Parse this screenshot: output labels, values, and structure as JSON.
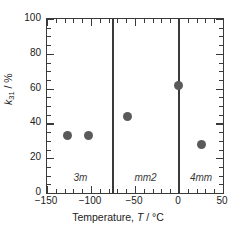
{
  "chart_data": {
    "type": "scatter",
    "title": "",
    "xlabel": "Temperature, T / °C",
    "ylabel": "k31 / %",
    "xlim": [
      -150,
      50
    ],
    "ylim": [
      0,
      100
    ],
    "grid": false,
    "legend": "none",
    "x_major_ticks": [
      -150,
      -100,
      -50,
      0,
      50
    ],
    "x_tick_labels": [
      "−150",
      "−100",
      "−50",
      "0",
      "50"
    ],
    "x_minor_step": 10,
    "y_major_ticks": [
      0,
      20,
      40,
      60,
      80,
      100
    ],
    "y_tick_labels": [
      "0",
      "20",
      "40",
      "60",
      "80",
      "100"
    ],
    "y_minor_step": 5,
    "series": [
      {
        "name": "k31",
        "marker": "filled-circle",
        "color": "#5a5a5a",
        "points": [
          {
            "x": -127,
            "y": 33
          },
          {
            "x": -103,
            "y": 33
          },
          {
            "x": -59,
            "y": 44
          },
          {
            "x": -1,
            "y": 62
          },
          {
            "x": 25,
            "y": 28
          }
        ]
      }
    ],
    "annotations": {
      "phase_boundaries": [
        -75,
        0
      ],
      "phase_regions": [
        {
          "label": "3m",
          "center_x": -112
        },
        {
          "label": "mm2",
          "center_x": -38
        },
        {
          "label": "4mm",
          "center_x": 25
        }
      ]
    }
  },
  "axis": {
    "y_label_symbol": "k",
    "y_label_subscript": "31",
    "y_label_units": " / %",
    "x_label_prefix": "Temperature, ",
    "x_label_symbol": "T",
    "x_label_units": " / °C"
  },
  "colors": {
    "marker": "#5a5a5a",
    "axis": "#3a3a3a",
    "text": "#222222",
    "background": "#ffffff"
  }
}
